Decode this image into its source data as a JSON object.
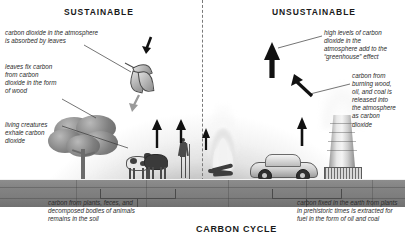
{
  "diagram": {
    "title": "CARBON CYCLE",
    "headings": {
      "left": "SUSTAINABLE",
      "right": "UNSUSTAINABLE"
    },
    "annotations": {
      "co2_absorbed": "carbon dioxide in the atmosphere\nis absorbed by leaves",
      "leaves_fix_carbon": "leaves fix carbon\nfrom carbon\ndioxide in the form\nof wood",
      "living_creatures": "living creatures\nexhale carbon\ndioxide",
      "soil_carbon": "carbon from plants, feces, and\ndecomposed bodies of animals\nremains in the soil",
      "high_levels": "high levels of carbon\ndioxide in the\natmosphere add to the\n“greenhouse” effect",
      "burning_fuel": "carbon from\nburning wood,\noil, and coal is\nreleased into\nthe atmosphere\nas carbon\ndioxide",
      "fossil_fuel": "carbon fixed in the earth from plants\nin prehistoric times is extracted for\nfuel in the form of oil and coal"
    },
    "scene_objects": {
      "tree": "tree",
      "cows": "cattle",
      "person": "farmer",
      "campfire": "open fire",
      "car": "automobile",
      "cooling_tower": "power plant cooling tower",
      "leaf_cluster": "leaf cluster",
      "soil_layer": "soil layer"
    },
    "colors": {
      "sky_dark": "#8f8f8f",
      "sky_light": "#ffffff",
      "ground": "#808080",
      "ink": "#1a1a1a",
      "note_text": "#2b2b2b"
    }
  }
}
